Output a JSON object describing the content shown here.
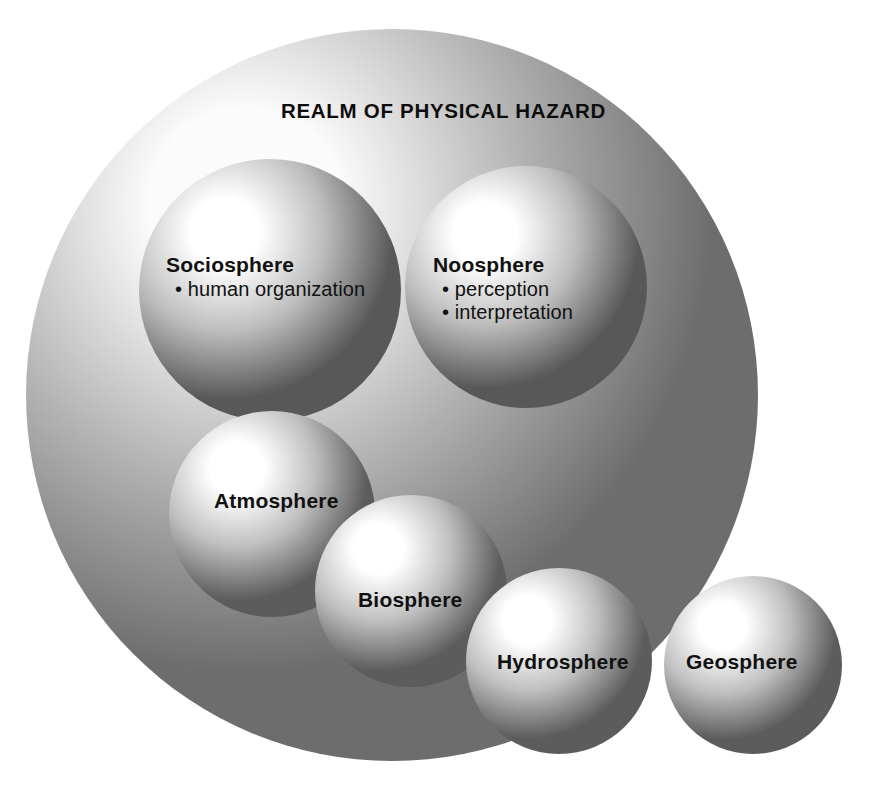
{
  "figure": {
    "title": "REALM OF PHYSICAL HAZARD",
    "caption": ""
  },
  "spheres": [
    {
      "id": "realm",
      "name": "Realm of Physical Hazard",
      "title": "REALM OF PHYSICAL HAZARD",
      "bullets": [],
      "cx": 392,
      "cy": 395,
      "r": 366,
      "light_x": 0.3,
      "light_y": 0.24,
      "highlight": "#fbfbfb",
      "mid": "#b4b4b4",
      "edge": "#6d6d6d"
    },
    {
      "id": "sociosphere",
      "name": "Sociosphere",
      "title": "Sociosphere",
      "bullets": [
        "• human organization"
      ],
      "cx": 270,
      "cy": 290,
      "r": 131,
      "light_x": 0.33,
      "light_y": 0.28,
      "highlight": "#ffffff",
      "mid": "#bdbdbd",
      "edge": "#585858"
    },
    {
      "id": "noosphere",
      "name": "Noosphere",
      "title": "Noosphere",
      "bullets": [
        "• perception",
        "• interpretation"
      ],
      "cx": 526,
      "cy": 287,
      "r": 121,
      "light_x": 0.33,
      "light_y": 0.28,
      "highlight": "#ffffff",
      "mid": "#bdbdbd",
      "edge": "#585858"
    },
    {
      "id": "atmosphere",
      "name": "Atmosphere",
      "title": "Atmosphere",
      "bullets": [],
      "cx": 272,
      "cy": 514,
      "r": 103,
      "light_x": 0.33,
      "light_y": 0.28,
      "highlight": "#ffffff",
      "mid": "#bfbfbf",
      "edge": "#5c5c5c"
    },
    {
      "id": "biosphere",
      "name": "Biosphere",
      "title": "Biosphere",
      "bullets": [],
      "cx": 411,
      "cy": 591,
      "r": 96,
      "light_x": 0.33,
      "light_y": 0.28,
      "highlight": "#ffffff",
      "mid": "#bfbfbf",
      "edge": "#5c5c5c"
    },
    {
      "id": "hydrosphere",
      "name": "Hydrosphere",
      "title": "Hydrosphere",
      "bullets": [],
      "cx": 559,
      "cy": 661,
      "r": 93,
      "light_x": 0.33,
      "light_y": 0.28,
      "highlight": "#ffffff",
      "mid": "#bfbfbf",
      "edge": "#5c5c5c"
    },
    {
      "id": "geosphere",
      "name": "Geosphere",
      "title": "Geosphere",
      "bullets": [],
      "cx": 753,
      "cy": 665,
      "r": 89,
      "light_x": 0.33,
      "light_y": 0.28,
      "highlight": "#ffffff",
      "mid": "#bfbfbf",
      "edge": "#5c5c5c"
    }
  ],
  "labels": {
    "realm": "REALM OF PHYSICAL HAZARD",
    "sociosphere_title": "Sociosphere",
    "sociosphere_bullet_1": "• human organization",
    "noosphere_title": "Noosphere",
    "noosphere_bullet_1": "• perception",
    "noosphere_bullet_2": "• interpretation",
    "atmosphere_title": "Atmosphere",
    "biosphere_title": "Biosphere",
    "hydrosphere_title": "Hydrosphere",
    "geosphere_title": "Geosphere"
  },
  "colors": {
    "background": "#ffffff",
    "text": "#111111",
    "sphere_highlight": "#ffffff",
    "sphere_mid": "#bdbdbd",
    "sphere_edge": "#585858"
  }
}
